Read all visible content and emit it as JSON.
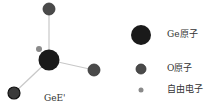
{
  "diagram": {
    "structure_label": "GeE'",
    "colors": {
      "bond": "#c8c8c8",
      "ge_atom": "#1a1a1a",
      "o_atom": "#4a4a4a",
      "free_electron": "#8a8a8a"
    }
  },
  "legend": {
    "items": [
      {
        "label": "Ge原子",
        "symbol": "ge-atom"
      },
      {
        "label": "O原子",
        "symbol": "o-atom"
      },
      {
        "label": "自由电子",
        "symbol": "free-electron"
      }
    ]
  }
}
